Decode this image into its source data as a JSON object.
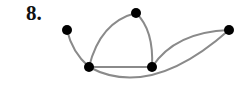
{
  "problem": {
    "number_label": "8."
  },
  "graph": {
    "edge_color": "#8a8a8a",
    "node_color": "#000000",
    "nodes": [
      {
        "id": "A",
        "x": 67,
        "y": 30
      },
      {
        "id": "B",
        "x": 136,
        "y": 13
      },
      {
        "id": "C",
        "x": 229,
        "y": 30
      },
      {
        "id": "D",
        "x": 89,
        "y": 67
      },
      {
        "id": "E",
        "x": 152,
        "y": 67
      }
    ],
    "edges": [
      {
        "from": "A",
        "to": "D",
        "path": "M67,30 Q72,52 89,67"
      },
      {
        "from": "D",
        "to": "B",
        "path": "M89,67 Q100,22 136,13"
      },
      {
        "from": "B",
        "to": "E",
        "path": "M136,13 Q154,30 152,67"
      },
      {
        "from": "D",
        "to": "E",
        "path": "M89,67 L152,67"
      },
      {
        "from": "E",
        "to": "C",
        "path": "M152,67 Q175,32 229,30"
      },
      {
        "from": "D",
        "to": "C",
        "path": "M89,67 Q150,100 229,30"
      }
    ]
  }
}
